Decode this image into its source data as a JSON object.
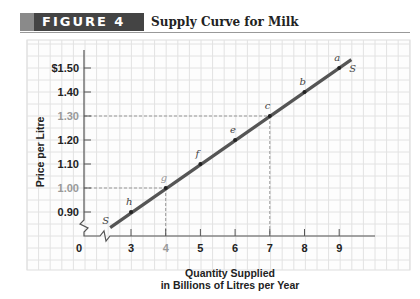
{
  "figure": {
    "tag": "FIGURE 4",
    "title": "Supply Curve for Milk"
  },
  "chart_data": {
    "type": "line",
    "title": "Supply Curve for Milk",
    "xlabel": "Quantity Supplied in Billions of Litres per Year",
    "xlabel_lines": [
      "Quantity Supplied",
      "in Billions of Litres per Year"
    ],
    "ylabel": "Price per Litre",
    "x_ticks": [
      "0",
      "3",
      "4",
      "5",
      "6",
      "7",
      "8",
      "9"
    ],
    "y_ticks": [
      "$1.50",
      "1.40",
      "1.30",
      "1.20",
      "1.10",
      "1.00",
      "0.90"
    ],
    "xlim": [
      0,
      9.5
    ],
    "ylim": [
      0.8,
      1.55
    ],
    "axis_breaks": true,
    "grid": true,
    "series": [
      {
        "name": "S",
        "curve_label": "S",
        "points": [
          {
            "label": "h",
            "x": 3,
            "y": 0.9
          },
          {
            "label": "g",
            "x": 4,
            "y": 1.0
          },
          {
            "label": "f",
            "x": 5,
            "y": 1.1
          },
          {
            "label": "e",
            "x": 6,
            "y": 1.2
          },
          {
            "label": "c",
            "x": 7,
            "y": 1.3
          },
          {
            "label": "b",
            "x": 8,
            "y": 1.4
          },
          {
            "label": "a",
            "x": 9,
            "y": 1.5
          }
        ]
      }
    ],
    "guides": [
      {
        "point": "g",
        "x": 4,
        "y": 1.0
      },
      {
        "point": "c",
        "x": 7,
        "y": 1.3
      }
    ]
  }
}
